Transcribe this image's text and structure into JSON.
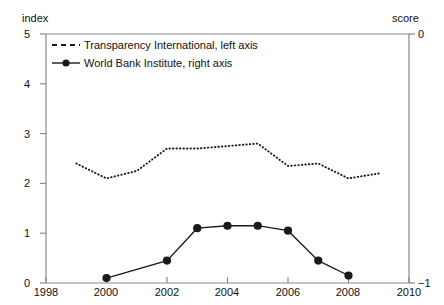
{
  "axes": {
    "left_title": "index",
    "right_title": "score",
    "left_ticks": [
      "5",
      "4",
      "3",
      "2",
      "1",
      "0"
    ],
    "right_ticks": [
      "0",
      "−1"
    ],
    "x_ticks": [
      "1998",
      "2000",
      "2002",
      "2004",
      "2006",
      "2008",
      "2010"
    ]
  },
  "legend": {
    "items": [
      {
        "label": "Transparency International, left axis",
        "style": "dashed",
        "marker": "none"
      },
      {
        "label": "World Bank Institute, right axis",
        "style": "solid",
        "marker": "circle"
      }
    ]
  },
  "colors": {
    "line": "#1a1a1a",
    "axis": "#8a8a8a",
    "background": "#ffffff"
  },
  "chart_data": {
    "type": "line",
    "title": "",
    "xlabel": "",
    "ylabel": "index",
    "y2label": "score",
    "xlim": [
      1998,
      2010
    ],
    "ylim": [
      0,
      5
    ],
    "y2lim": [
      -1,
      0
    ],
    "grid": false,
    "legend_position": "top-left inside plot",
    "xticks": [
      1998,
      2000,
      2002,
      2004,
      2006,
      2008,
      2010
    ],
    "yticks": [
      0,
      1,
      2,
      3,
      4,
      5
    ],
    "y2ticks": [
      -1,
      0
    ],
    "series": [
      {
        "name": "Transparency International, left axis",
        "axis": "left",
        "style": "dotted",
        "marker": "none",
        "x": [
          1999,
          2000,
          2001,
          2002,
          2003,
          2004,
          2005,
          2006,
          2007,
          2008,
          2009
        ],
        "values": [
          2.4,
          2.1,
          2.25,
          2.7,
          2.7,
          2.75,
          2.8,
          2.35,
          2.4,
          2.1,
          2.2
        ]
      },
      {
        "name": "World Bank Institute, right axis",
        "axis": "right",
        "style": "solid",
        "marker": "circle",
        "x": [
          2000,
          2002,
          2003,
          2004,
          2005,
          2006,
          2007,
          2008
        ],
        "values": [
          -0.98,
          -0.91,
          -0.78,
          -0.77,
          -0.77,
          -0.79,
          -0.91,
          -0.97
        ],
        "values_left_axis_equivalent": [
          0.1,
          0.47,
          1.12,
          1.15,
          1.17,
          1.05,
          0.45,
          0.13
        ]
      }
    ]
  }
}
